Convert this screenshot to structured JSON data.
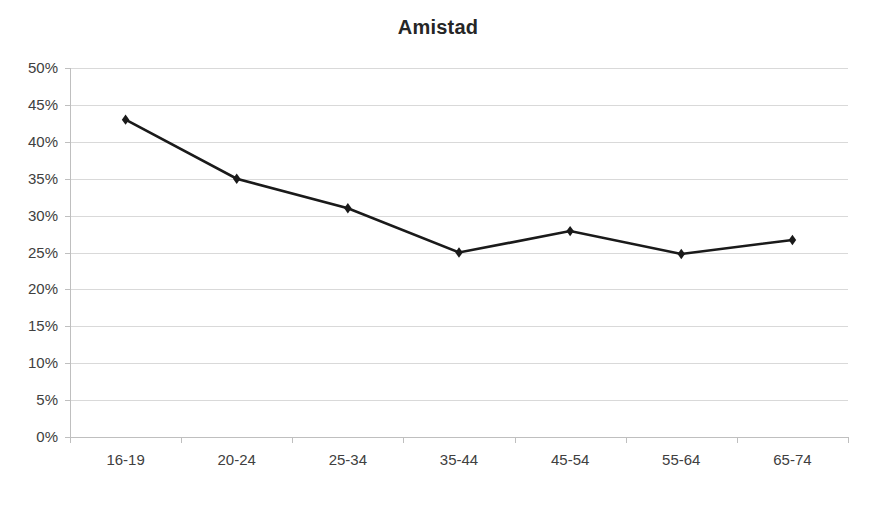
{
  "chart_data": {
    "type": "line",
    "title": "Amistad",
    "xlabel": "",
    "ylabel": "",
    "categories": [
      "16-19",
      "20-24",
      "25-34",
      "35-44",
      "45-54",
      "55-64",
      "65-74"
    ],
    "values": [
      43,
      35,
      31,
      25,
      27.9,
      24.8,
      26.7
    ],
    "series": [
      {
        "name": "Amistad",
        "values": [
          43,
          35,
          31,
          25,
          27.9,
          24.8,
          26.7
        ]
      }
    ],
    "ylim": [
      0,
      50
    ],
    "ytick_step": 5,
    "ytick_labels": [
      "0%",
      "5%",
      "10%",
      "15%",
      "20%",
      "25%",
      "30%",
      "35%",
      "40%",
      "45%",
      "50%"
    ],
    "ytick_values": [
      0,
      5,
      10,
      15,
      20,
      25,
      30,
      35,
      40,
      45,
      50
    ],
    "value_format": "percent",
    "grid": true,
    "grid_axis": "y",
    "legend": false,
    "legend_position": "none",
    "marker": "diamond",
    "colors": {
      "series_line": "#1a1a1a",
      "series_marker": "#1a1a1a",
      "gridline": "#d9d9d9",
      "axis": "#bfbfbf",
      "title_text": "#262626",
      "tick_text": "#404040",
      "background": "#ffffff"
    }
  }
}
